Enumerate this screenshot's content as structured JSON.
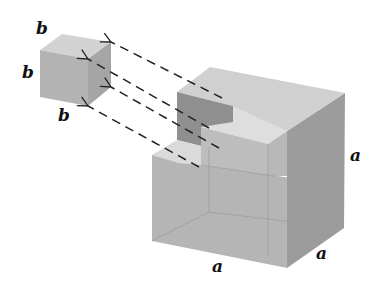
{
  "figure": {
    "small_cube": {
      "labels": [
        "b",
        "b",
        "b"
      ]
    },
    "big_cube": {
      "labels": [
        "a",
        "a",
        "a"
      ]
    },
    "arrow_count": 4,
    "colors": {
      "front_face": "#b5b5b5",
      "top_face": "#d2d2d2",
      "right_face": "#9c9c9c",
      "notch_dark": "#8f8f8f",
      "notch_light": "#dcdcdc",
      "line": "#222222"
    }
  }
}
